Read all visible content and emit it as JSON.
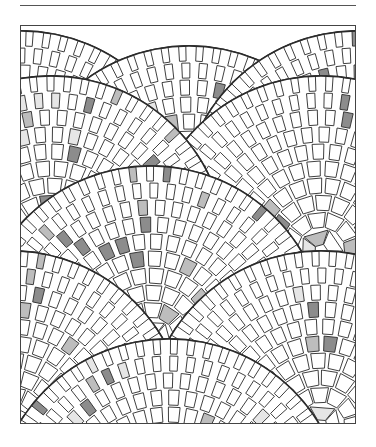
{
  "figure": {
    "width": 336,
    "height": 399,
    "colors": {
      "tile": "#ffffff",
      "grout": "#2a2a2a",
      "shade_light": "#e6e6e6",
      "shade_mid": "#bdbdbd",
      "shade_dark": "#8c8c8c",
      "rule": "#555555"
    },
    "fan": {
      "outer_radius": 176,
      "tile_size": 17,
      "rings": 9
    },
    "fans": [
      {
        "cx": 0,
        "cy": 180
      },
      {
        "cx": 168,
        "cy": 195
      },
      {
        "cx": 336,
        "cy": 180
      },
      {
        "cx": 300,
        "cy": 225
      },
      {
        "cx": 30,
        "cy": 225
      },
      {
        "cx": 130,
        "cy": 315
      },
      {
        "cx": 300,
        "cy": 400
      },
      {
        "cx": -10,
        "cy": 400
      },
      {
        "cx": 148,
        "cy": 488
      }
    ]
  }
}
